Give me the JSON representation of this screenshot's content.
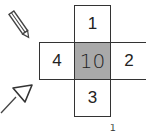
{
  "diagram": {
    "type": "cross-grid",
    "cells": {
      "top": "1",
      "left": "4",
      "center": "10",
      "right": "2",
      "bottom": "3"
    },
    "center_fill": "#a9a9a9",
    "icons": [
      "pencil-icon",
      "arrow-icon"
    ],
    "bottom_mark": "1"
  }
}
